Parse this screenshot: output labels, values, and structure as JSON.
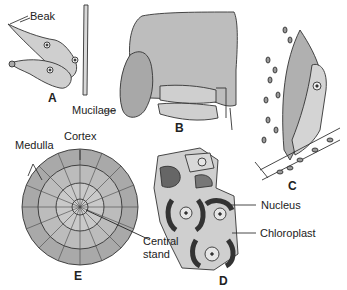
{
  "diagram": {
    "panels": [
      {
        "id": "A",
        "label": "A",
        "annotations": [
          "Beak"
        ]
      },
      {
        "id": "B",
        "label": "B",
        "annotations": [
          "Mucilage"
        ]
      },
      {
        "id": "C",
        "label": "C",
        "annotations": []
      },
      {
        "id": "D",
        "label": "D",
        "annotations": [
          "Nucleus",
          "Chloroplast"
        ]
      },
      {
        "id": "E",
        "label": "E",
        "annotations": [
          "Medulla",
          "Cortex",
          "Central stand"
        ]
      }
    ],
    "labels": {
      "beak": "Beak",
      "mucilage": "Mucilage",
      "medulla": "Medulla",
      "cortex": "Cortex",
      "central_line1": "Central",
      "central_line2": "stand",
      "nucleus": "Nucleus",
      "chloroplast": "Chloroplast"
    },
    "colors": {
      "fill_gray": "#b8b8b8",
      "fill_light": "#d4d4d4",
      "stroke": "#333333",
      "text": "#222222"
    }
  }
}
